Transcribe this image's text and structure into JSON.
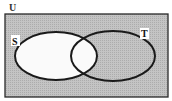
{
  "diagram": {
    "type": "venn",
    "universe_label": "U",
    "sets": [
      {
        "label": "S"
      },
      {
        "label": "T"
      }
    ],
    "shaded_region": "complement of S (U minus S)",
    "colors": {
      "shade": "#b8b8b8",
      "unshaded": "#ffffff",
      "outline": "#1a1a1a"
    }
  }
}
